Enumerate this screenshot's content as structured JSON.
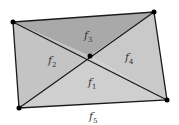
{
  "diagram": {
    "vertices": {
      "tl": [
        13,
        22
      ],
      "tr": [
        154,
        12
      ],
      "br": [
        167,
        100
      ],
      "bl": [
        19,
        108
      ],
      "center": [
        90,
        56
      ]
    },
    "faces": [
      {
        "name": "f",
        "sub": "1",
        "pos": [
          88,
          85
        ],
        "fill": "#cfcfcf"
      },
      {
        "name": "f",
        "sub": "2",
        "pos": [
          48,
          62
        ],
        "fill": "#c4c4c4"
      },
      {
        "name": "f",
        "sub": "3",
        "pos": [
          84,
          37
        ],
        "fill": "#a9a9a9"
      },
      {
        "name": "f",
        "sub": "4",
        "pos": [
          126,
          59
        ],
        "fill": "#c9c9c9"
      },
      {
        "name": "f",
        "sub": "5",
        "pos": [
          90,
          120
        ],
        "fill": "#ffffff"
      }
    ],
    "stroke_color": "#1a1a1a",
    "vertex_color": "#000000"
  }
}
